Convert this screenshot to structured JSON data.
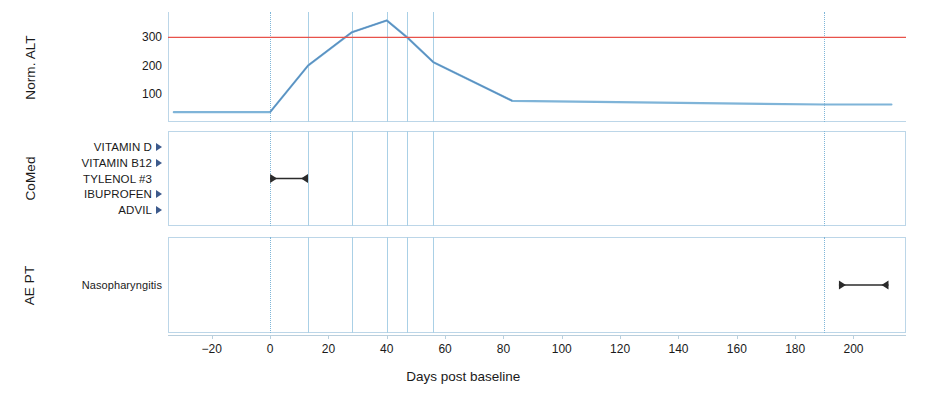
{
  "figure": {
    "background": "#ffffff",
    "x_axis": {
      "title": "Days post baseline",
      "ticks": [
        -20,
        0,
        20,
        40,
        60,
        80,
        100,
        120,
        140,
        160,
        180,
        200
      ],
      "tick_labels": [
        "−20",
        "0",
        "20",
        "40",
        "60",
        "80",
        "100",
        "120",
        "140",
        "160",
        "180",
        "200"
      ],
      "range": [
        -35,
        218
      ]
    },
    "event_gridlines_days": [
      0,
      13,
      28,
      40,
      47,
      56,
      190
    ],
    "colors": {
      "alt_line": "#7fb4d8",
      "alt_line_dark": "#5a8fc0",
      "threshold_line": "#e8524a",
      "gridline": "#7fb6d8",
      "frame": "#bcd6e8",
      "marker": "#3c5a8c",
      "bar": "#2b2b2b",
      "text": "#1a1a1a"
    }
  },
  "panels": {
    "alt": {
      "title": "Norm. ALT",
      "y_ticks": [
        100,
        200,
        300
      ],
      "y_tick_labels": [
        "100",
        "200",
        "300"
      ],
      "y_range": [
        0,
        390
      ],
      "threshold_value": 300
    },
    "comed": {
      "title": "CoMed",
      "rows": [
        {
          "label": "VITAMIN D",
          "marker": "right-triangle",
          "bar": null
        },
        {
          "label": "VITAMIN B12",
          "marker": "right-triangle",
          "bar": null
        },
        {
          "label": "TYLENOL #3",
          "marker": null,
          "bar": {
            "start": 0,
            "end": 13
          }
        },
        {
          "label": "IBUPROFEN",
          "marker": "right-triangle",
          "bar": null
        },
        {
          "label": "ADVIL",
          "marker": "right-triangle",
          "bar": null
        }
      ]
    },
    "ae": {
      "title": "AE PT",
      "rows": [
        {
          "label": "Nasopharyngitis",
          "marker": null,
          "bar": {
            "start": 195,
            "end": 212
          }
        }
      ]
    }
  },
  "chart_data": {
    "type": "line",
    "title": "",
    "xlabel": "Days post baseline",
    "ylabel": "Norm. ALT",
    "xlim": [
      -35,
      218
    ],
    "ylim": [
      0,
      390
    ],
    "grid": true,
    "legend": "none",
    "series": [
      {
        "name": "Norm. ALT",
        "color": "#7fb4d8",
        "x": [
          -33,
          0,
          13,
          28,
          40,
          47,
          56,
          83,
          190,
          213
        ],
        "y": [
          35,
          35,
          200,
          318,
          360,
          300,
          212,
          75,
          62,
          62
        ]
      },
      {
        "name": "ALT threshold (3xULN)",
        "color": "#e8524a",
        "type": "hline",
        "y": 300
      }
    ],
    "annotations": {
      "event_markers_days": [
        0,
        13,
        28,
        40,
        47,
        56,
        190
      ],
      "comed_events": [
        {
          "name": "VITAMIN D",
          "kind": "point",
          "day": null
        },
        {
          "name": "VITAMIN B12",
          "kind": "point",
          "day": null
        },
        {
          "name": "TYLENOL #3",
          "kind": "interval",
          "start": 0,
          "end": 13
        },
        {
          "name": "IBUPROFEN",
          "kind": "point",
          "day": null
        },
        {
          "name": "ADVIL",
          "kind": "point",
          "day": null
        }
      ],
      "ae_events": [
        {
          "name": "Nasopharyngitis",
          "kind": "interval",
          "start": 195,
          "end": 212
        }
      ]
    }
  }
}
